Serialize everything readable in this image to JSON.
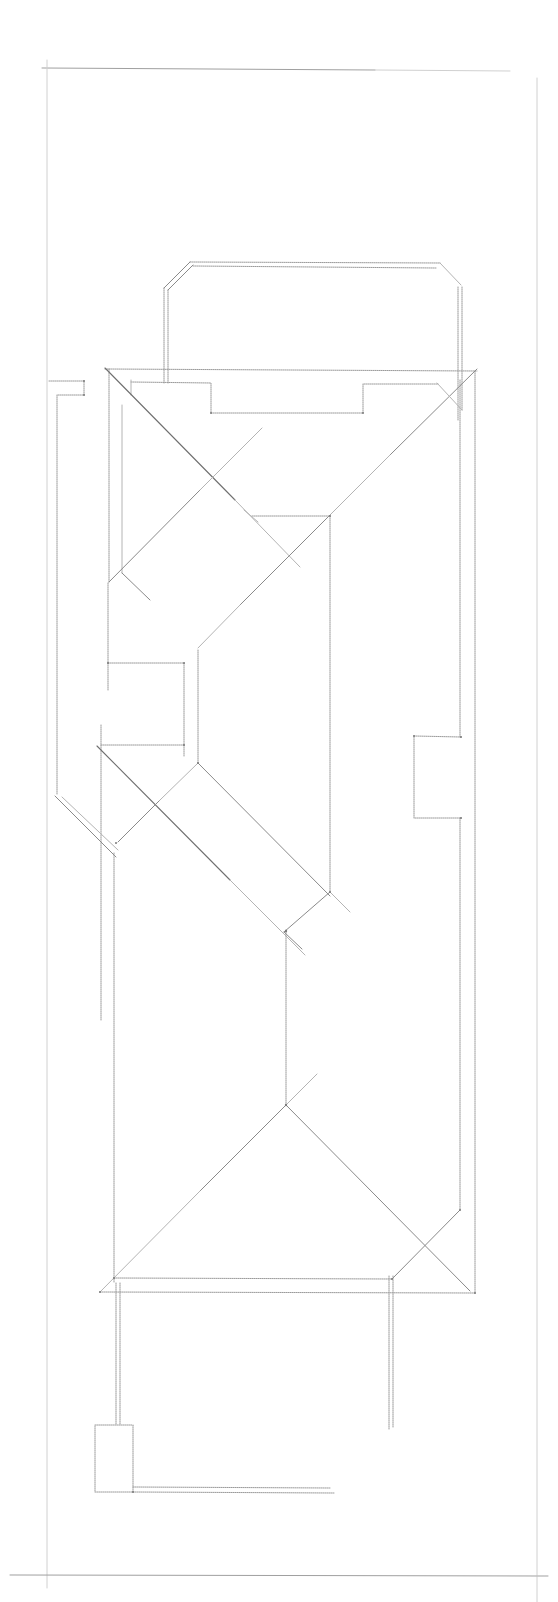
{
  "drawing": {
    "type": "roof-plan-line-drawing",
    "width": 558,
    "height": 1602,
    "background": "#ffffff",
    "line_color": "#8a8a8a",
    "frame": {
      "top": [
        42,
        68,
        510,
        70
      ],
      "left": [
        47,
        60,
        47,
        1585
      ],
      "right": [
        537,
        78,
        537,
        1602
      ],
      "bottom": [
        10,
        1575,
        548,
        1576
      ]
    },
    "upper_block": {
      "outer": [
        [
          164,
          383
        ],
        [
          164,
          288
        ],
        [
          190,
          262
        ],
        [
          440,
          262
        ],
        [
          460,
          284
        ],
        [
          460,
          410
        ]
      ],
      "inner": [
        [
          168,
          383
        ],
        [
          168,
          290
        ],
        [
          193,
          266
        ],
        [
          438,
          266
        ]
      ],
      "inner_right": [
        [
          456,
          288
        ],
        [
          456,
          420
        ]
      ]
    },
    "main_outline": {
      "top_eave": [
        [
          105,
          369
        ],
        [
          477,
          371
        ]
      ],
      "left_wall": [
        [
          109,
          369
        ],
        [
          109,
          583
        ]
      ],
      "right_wall": [
        [
          475,
          371
        ],
        [
          475,
          1273
        ]
      ],
      "inner_right_wall": [
        [
          460,
          380
        ],
        [
          460,
          735
        ]
      ]
    },
    "top_recess": [
      [
        131,
        382
      ],
      [
        211,
        383
      ],
      [
        211,
        413
      ],
      [
        363,
        413
      ],
      [
        363,
        384
      ],
      [
        438,
        384
      ]
    ],
    "left_stub": {
      "top": [
        [
          49,
          381
        ],
        [
          84,
          381
        ],
        [
          84,
          395
        ],
        [
          57,
          395
        ]
      ],
      "wall": [
        [
          57,
          395
        ],
        [
          57,
          795
        ]
      ]
    },
    "hips": [
      [
        [
          105,
          368
        ],
        [
          300,
          567
        ]
      ],
      [
        [
          477,
          369
        ],
        [
          168,
          677
        ]
      ],
      [
        [
          437,
          383
        ],
        [
          462,
          410
        ]
      ],
      [
        [
          109,
          582
        ],
        [
          280,
          413
        ]
      ],
      [
        [
          200,
          613
        ],
        [
          232,
          580
        ]
      ],
      [
        [
          232,
          499
        ],
        [
          263,
          499
        ]
      ]
    ],
    "middle": {
      "ridge_hz": [
        [
          252,
          516
        ],
        [
          330,
          516
        ]
      ],
      "ridge_vt": [
        [
          330,
          516
        ],
        [
          330,
          892
        ]
      ],
      "box": [
        [
          108,
          663
        ],
        [
          184,
          663
        ],
        [
          184,
          745
        ],
        [
          108,
          745
        ]
      ],
      "box_right": [
        [
          198,
          650
        ],
        [
          198,
          763
        ]
      ],
      "box_top_vt": [
        [
          108,
          583
        ],
        [
          108,
          690
        ]
      ]
    },
    "lower_hips": [
      [
        [
          97,
          746
        ],
        [
          300,
          952
        ]
      ],
      [
        [
          198,
          763
        ],
        [
          340,
          907
        ]
      ],
      [
        [
          159,
          838
        ],
        [
          118,
          880
        ]
      ],
      [
        [
          283,
          930
        ],
        [
          330,
          892
        ]
      ],
      [
        [
          283,
          930
        ],
        [
          302,
          948
        ]
      ],
      [
        [
          330,
          892
        ],
        [
          350,
          911
        ]
      ],
      [
        [
          55,
          796
        ],
        [
          114,
          853
        ]
      ],
      [
        [
          62,
          795
        ],
        [
          118,
          850
        ]
      ]
    ],
    "right_bay": [
      [
        465,
        737
      ],
      [
        414,
        736
      ],
      [
        414,
        818
      ],
      [
        465,
        818
      ]
    ],
    "center_line": [
      [
        286,
        930
      ],
      [
        286,
        1105
      ]
    ],
    "lower_roof": {
      "peak": [
        286,
        1105
      ],
      "left_hip": [
        [
          286,
          1105
        ],
        [
          100,
          1291
        ]
      ],
      "right_hip": [
        [
          286,
          1105
        ],
        [
          470,
          1290
        ]
      ],
      "peak_extend": [
        [
          286,
          1105
        ],
        [
          317,
          1073
        ]
      ],
      "right_valley": [
        [
          460,
          1210
        ],
        [
          392,
          1279
        ]
      ]
    },
    "bottom_eaves": {
      "inner": [
        [
          114,
          1278
        ],
        [
          392,
          1279
        ]
      ],
      "outer": [
        [
          100,
          1292
        ],
        [
          475,
          1293
        ]
      ]
    },
    "left_posts": [
      [
        [
          100,
          1020
        ],
        [
          100,
          1292
        ]
      ],
      [
        [
          114,
          853
        ],
        [
          114,
          1283
        ]
      ],
      [
        [
          116,
          1283
        ],
        [
          116,
          1425
        ]
      ],
      [
        [
          120,
          1283
        ],
        [
          120,
          1425
        ]
      ]
    ],
    "right_post": [
      [
        389,
        1276
      ],
      [
        389,
        1430
      ],
      [
        393,
        1276
      ],
      [
        393,
        1428
      ]
    ],
    "bottom_box": [
      [
        95,
        1425
      ],
      [
        133,
        1425
      ],
      [
        133,
        1492
      ],
      [
        95,
        1492
      ]
    ],
    "bottom_rail": [
      [
        133,
        1487
      ],
      [
        330,
        1488
      ],
      [
        133,
        1492
      ],
      [
        333,
        1493
      ]
    ]
  }
}
